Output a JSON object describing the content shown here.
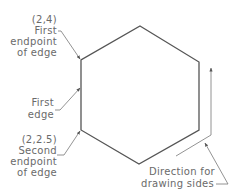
{
  "diagram": {
    "type": "hexagon-construction",
    "shape": "hexagon",
    "vertices_px": [
      [
        140,
        26
      ],
      [
        199,
        62
      ],
      [
        199,
        130
      ],
      [
        139,
        164
      ],
      [
        81,
        130
      ],
      [
        81,
        60
      ]
    ],
    "colors": {
      "shape": "#555555",
      "text": "#6a6a6a",
      "leader": "#777777",
      "background": "#ffffff"
    },
    "labels": {
      "first_endpoint": {
        "coord": "(2,4)",
        "line1": "First",
        "line2": "endpoint",
        "line3": "of edge"
      },
      "first_edge": {
        "line1": "First",
        "line2": "edge"
      },
      "second_endpoint": {
        "coord": "(2,2.5)",
        "line1": "Second",
        "line2": "endpoint",
        "line3": "of edge"
      },
      "direction": {
        "line1": "Direction for",
        "line2": "drawing sides"
      }
    }
  }
}
